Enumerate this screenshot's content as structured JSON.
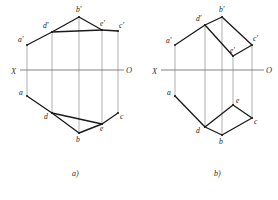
{
  "page": {
    "background_color": "#ffffff",
    "width": 278,
    "height": 200
  },
  "style": {
    "edge_color": "#1b1b1b",
    "axis_color": "#6d6d6d",
    "projector_color": "#8d8d8d",
    "label_color": "#1b1b1b"
  },
  "diagrams": [
    {
      "id": "diagram-a",
      "caption": "a)",
      "caption_x": 72,
      "caption_y": 176,
      "axis": {
        "label_left": "X",
        "label_right": "O",
        "label_left_x": 11,
        "label_left_y": 74,
        "label_right_x": 126,
        "label_right_y": 73,
        "x1": 20,
        "y1": 70,
        "x2": 124,
        "y2": 70
      },
      "upper_view": {
        "name": "frontal-projection",
        "vertices": [
          {
            "key": "a_prime",
            "label": "a'",
            "x": 27,
            "y": 45,
            "label_x": 18,
            "label_y": 42
          },
          {
            "key": "b_prime",
            "label": "b'",
            "x": 79,
            "y": 17,
            "label_x": 76,
            "label_y": 12
          },
          {
            "key": "c_prime",
            "label": "c'",
            "x": 118,
            "y": 31,
            "label_x": 119,
            "label_y": 28
          },
          {
            "key": "d_prime",
            "label": "d'",
            "x": 52,
            "y": 32,
            "label_x": 43,
            "label_y": 28
          },
          {
            "key": "e_prime",
            "label": "e'",
            "x": 102,
            "y": 30,
            "label_x": 100,
            "label_y": 26
          }
        ],
        "edges": [
          [
            "a_prime",
            "d_prime"
          ],
          [
            "d_prime",
            "b_prime"
          ],
          [
            "b_prime",
            "e_prime"
          ],
          [
            "e_prime",
            "c_prime"
          ],
          [
            "d_prime",
            "e_prime"
          ]
        ]
      },
      "lower_view": {
        "name": "horizontal-projection",
        "vertices": [
          {
            "key": "a",
            "label": "a",
            "x": 27,
            "y": 96,
            "label_x": 19,
            "label_y": 95
          },
          {
            "key": "b",
            "label": "b",
            "x": 79,
            "y": 133,
            "label_x": 76,
            "label_y": 142
          },
          {
            "key": "c",
            "label": "c",
            "x": 118,
            "y": 113,
            "label_x": 120,
            "label_y": 119
          },
          {
            "key": "d",
            "label": "d",
            "x": 52,
            "y": 113,
            "label_x": 44,
            "label_y": 119
          },
          {
            "key": "e",
            "label": "e",
            "x": 102,
            "y": 124,
            "label_x": 100,
            "label_y": 131
          }
        ],
        "edges": [
          [
            "a",
            "d"
          ],
          [
            "d",
            "b"
          ],
          [
            "b",
            "e"
          ],
          [
            "e",
            "c"
          ],
          [
            "d",
            "e"
          ]
        ]
      },
      "projectors": [
        {
          "key": "a",
          "x": 27,
          "y_top": 45,
          "y_bottom": 96
        },
        {
          "key": "d",
          "x": 52,
          "y_top": 32,
          "y_bottom": 113
        },
        {
          "key": "b",
          "x": 79,
          "y_top": 17,
          "y_bottom": 133
        },
        {
          "key": "e",
          "x": 102,
          "y_top": 30,
          "y_bottom": 124
        },
        {
          "key": "c",
          "x": 118,
          "y_top": 31,
          "y_bottom": 113
        }
      ]
    },
    {
      "id": "diagram-b",
      "caption": "b)",
      "caption_x": 214,
      "caption_y": 176,
      "axis": {
        "label_left": "X",
        "label_right": "O",
        "label_left_x": 152,
        "label_left_y": 74,
        "label_right_x": 266,
        "label_right_y": 73,
        "x1": 161,
        "y1": 70,
        "x2": 264,
        "y2": 70
      },
      "upper_view": {
        "name": "frontal-projection",
        "vertices": [
          {
            "key": "a_prime",
            "label": "a'",
            "x": 175,
            "y": 45,
            "label_x": 166,
            "label_y": 43
          },
          {
            "key": "b_prime",
            "label": "b'",
            "x": 222,
            "y": 17,
            "label_x": 219,
            "label_y": 12
          },
          {
            "key": "c_prime",
            "label": "c'",
            "x": 252,
            "y": 45,
            "label_x": 253,
            "label_y": 41
          },
          {
            "key": "d_prime",
            "label": "d'",
            "x": 205,
            "y": 25,
            "label_x": 196,
            "label_y": 21
          },
          {
            "key": "e_prime",
            "label": "e'",
            "x": 233,
            "y": 56,
            "label_x": 230,
            "label_y": 53
          }
        ],
        "edges": [
          [
            "a_prime",
            "d_prime"
          ],
          [
            "d_prime",
            "b_prime"
          ],
          [
            "b_prime",
            "c_prime"
          ],
          [
            "d_prime",
            "e_prime"
          ],
          [
            "e_prime",
            "c_prime"
          ]
        ]
      },
      "lower_view": {
        "name": "horizontal-projection",
        "vertices": [
          {
            "key": "a",
            "label": "a",
            "x": 175,
            "y": 96,
            "label_x": 167,
            "label_y": 95
          },
          {
            "key": "b",
            "label": "b",
            "x": 222,
            "y": 135,
            "label_x": 219,
            "label_y": 144
          },
          {
            "key": "c",
            "label": "c",
            "x": 252,
            "y": 118,
            "label_x": 254,
            "label_y": 124
          },
          {
            "key": "d",
            "label": "d",
            "x": 205,
            "y": 127,
            "label_x": 196,
            "label_y": 133
          },
          {
            "key": "e",
            "label": "e",
            "x": 233,
            "y": 105,
            "label_x": 236,
            "label_y": 103
          }
        ],
        "edges": [
          [
            "a",
            "d"
          ],
          [
            "d",
            "b"
          ],
          [
            "b",
            "c"
          ],
          [
            "d",
            "e"
          ],
          [
            "e",
            "c"
          ]
        ]
      },
      "projectors": [
        {
          "key": "a",
          "x": 175,
          "y_top": 45,
          "y_bottom": 96
        },
        {
          "key": "d",
          "x": 205,
          "y_top": 25,
          "y_bottom": 127
        },
        {
          "key": "b",
          "x": 222,
          "y_top": 17,
          "y_bottom": 135
        },
        {
          "key": "e",
          "x": 233,
          "y_top": 56,
          "y_bottom": 105
        },
        {
          "key": "c",
          "x": 252,
          "y_top": 45,
          "y_bottom": 118
        }
      ]
    }
  ]
}
